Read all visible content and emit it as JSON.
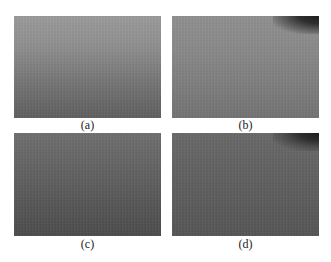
{
  "figure": {
    "panels": [
      {
        "id": "a",
        "caption": "(a)",
        "shade_top": "#9a9a9a",
        "shade_bottom": "#5e5e5e",
        "dark_corner": false
      },
      {
        "id": "b",
        "caption": "(b)",
        "shade_top": "#8f8f8f",
        "shade_bottom": "#727272",
        "dark_corner": true
      },
      {
        "id": "c",
        "caption": "(c)",
        "shade_top": "#6e6e6e",
        "shade_bottom": "#4b4b4b",
        "dark_corner": false
      },
      {
        "id": "d",
        "caption": "(d)",
        "shade_top": "#686868",
        "shade_bottom": "#545454",
        "dark_corner": true
      }
    ]
  }
}
